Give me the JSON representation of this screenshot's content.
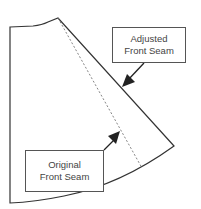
{
  "diagram": {
    "labels": {
      "adjusted": {
        "line1": "Adjusted",
        "line2": "Front Seam"
      },
      "original": {
        "line1": "Original",
        "line2": "Front Seam"
      }
    },
    "colors": {
      "stroke": "#333333",
      "dashed": "#777777",
      "background": "#ffffff"
    }
  }
}
